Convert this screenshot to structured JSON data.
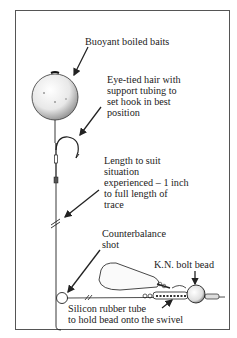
{
  "diagram": {
    "type": "fishing rig illustration",
    "labels": {
      "bait": {
        "lines": [
          "Buoyant boiled baits"
        ]
      },
      "hair": {
        "lines": [
          "Eye-tied hair with",
          "support tubing to",
          "set hook in best",
          "position"
        ]
      },
      "length": {
        "lines": [
          "Length to suit",
          "situation",
          "experienced – 1 inch",
          "to full length of",
          "trace"
        ]
      },
      "shot": {
        "lines": [
          "Counterbalance",
          "shot"
        ]
      },
      "bead": {
        "lines": [
          "K.N. bolt bead"
        ]
      },
      "tube": {
        "lines": [
          "Silicon rubber tube",
          "to hold bead onto the swivel"
        ]
      }
    },
    "components": [
      "boilie",
      "hook",
      "hooklength",
      "counterbalance-shot",
      "lead-weight",
      "swivel",
      "silicone-tube",
      "bolt-bead",
      "main-line"
    ],
    "colors": {
      "ink": "#222222",
      "frame": "#555555",
      "background": "#ffffff"
    }
  }
}
